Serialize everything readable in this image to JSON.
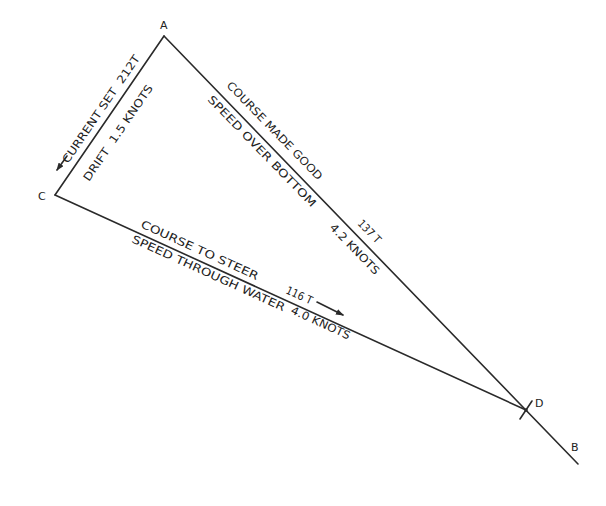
{
  "diagram": {
    "type": "current-vector-triangle",
    "points": {
      "A": {
        "label": "A"
      },
      "B": {
        "label": "B"
      },
      "C": {
        "label": "C"
      },
      "D": {
        "label": "D"
      }
    },
    "current_leg": {
      "from": "A",
      "to": "C",
      "set_label": "CURRENT SET",
      "set_value": "212T",
      "drift_label": "DRIFT",
      "drift_value": "1.5 KNOTS",
      "line1": "CURRENT SET  212T",
      "line2": "DRIFT  1.5 KNOTS"
    },
    "course_made_good_leg": {
      "from": "A",
      "to": "B",
      "line1": "COURSE MADE GOOD",
      "line2": "SPEED OVER BOTTOM",
      "course_value": "137 T",
      "speed_value": "4.2 KNOTS"
    },
    "course_to_steer_leg": {
      "from": "C",
      "to": "D",
      "line1": "COURSE TO STEER",
      "line2": "SPEED THROUGH WATER",
      "course_value": "116 T",
      "speed_value": "4.0 KNOTS"
    },
    "colors": {
      "line": "#2a2a2a",
      "text": "#222222",
      "background": "#ffffff"
    }
  }
}
